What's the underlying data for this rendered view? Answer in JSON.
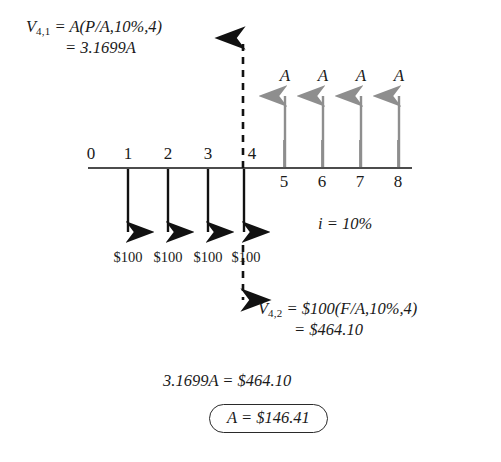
{
  "figure": {
    "type": "cash-flow-diagram",
    "interest_rate_label": "i = 10%",
    "timeline": {
      "periods": [
        "0",
        "1",
        "2",
        "3",
        "4",
        "5",
        "6",
        "7",
        "8"
      ]
    },
    "outflows": {
      "amount_label": "$100",
      "labels": [
        "$100",
        "$100",
        "$100",
        "$100"
      ],
      "periods": [
        1,
        2,
        3,
        4
      ],
      "direction": "down",
      "color": "#111111"
    },
    "inflows": {
      "amount_label": "A",
      "labels": [
        "A",
        "A",
        "A",
        "A"
      ],
      "periods": [
        5,
        6,
        7,
        8
      ],
      "direction": "up",
      "color": "#8e8e8e"
    },
    "equations": {
      "top_line1_lhs": "V",
      "top_line1_sub": "4,1",
      "top_line1_rhs": " = A(P/A,10%,4)",
      "top_line2": "= 3.1699A",
      "bottom_line1_lhs": "V",
      "bottom_line1_sub": "4,2",
      "bottom_line1_rhs": " = $100(F/A,10%,4)",
      "bottom_line2": "= $464.10",
      "bottom_line3": "3.1699A = $464.10",
      "answer": "A = $146.41"
    }
  }
}
